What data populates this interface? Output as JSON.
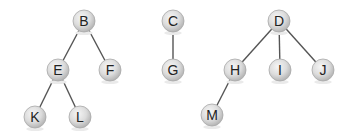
{
  "diagram": {
    "type": "forest",
    "node_radius": 11,
    "colors": {
      "edge": "#555555",
      "node_fill_light": "#f4f4f4",
      "node_fill_dark": "#bdbdbd",
      "node_stroke": "#a8a8a8",
      "label": "#222222"
    },
    "nodes": [
      {
        "id": "B",
        "label": "B",
        "x": 84,
        "y": 21
      },
      {
        "id": "E",
        "label": "E",
        "x": 58,
        "y": 70
      },
      {
        "id": "F",
        "label": "F",
        "x": 110,
        "y": 70
      },
      {
        "id": "K",
        "label": "K",
        "x": 35,
        "y": 117
      },
      {
        "id": "L",
        "label": "L",
        "x": 80,
        "y": 117
      },
      {
        "id": "C",
        "label": "C",
        "x": 173,
        "y": 21
      },
      {
        "id": "G",
        "label": "G",
        "x": 173,
        "y": 70
      },
      {
        "id": "D",
        "label": "D",
        "x": 279,
        "y": 21
      },
      {
        "id": "H",
        "label": "H",
        "x": 235,
        "y": 70
      },
      {
        "id": "I",
        "label": "I",
        "x": 280,
        "y": 70
      },
      {
        "id": "J",
        "label": "J",
        "x": 323,
        "y": 70
      },
      {
        "id": "M",
        "label": "M",
        "x": 212,
        "y": 115
      }
    ],
    "edges": [
      {
        "from": "B",
        "to": "E"
      },
      {
        "from": "B",
        "to": "F"
      },
      {
        "from": "E",
        "to": "K"
      },
      {
        "from": "E",
        "to": "L"
      },
      {
        "from": "C",
        "to": "G"
      },
      {
        "from": "D",
        "to": "H"
      },
      {
        "from": "D",
        "to": "I"
      },
      {
        "from": "D",
        "to": "J"
      },
      {
        "from": "H",
        "to": "M"
      }
    ],
    "trees": [
      {
        "root": "B",
        "members": [
          "B",
          "E",
          "F",
          "K",
          "L"
        ]
      },
      {
        "root": "C",
        "members": [
          "C",
          "G"
        ]
      },
      {
        "root": "D",
        "members": [
          "D",
          "H",
          "I",
          "J",
          "M"
        ]
      }
    ]
  }
}
